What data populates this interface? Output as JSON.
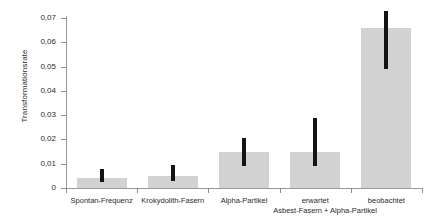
{
  "chart_data": {
    "type": "bar",
    "title": "",
    "xlabel": "",
    "ylabel": "Transformationsrate",
    "ylim": [
      0,
      0.07
    ],
    "yticks": [
      0,
      0.01,
      0.02,
      0.03,
      0.04,
      0.05,
      0.06,
      0.07
    ],
    "ytick_labels": [
      "0",
      "0,01",
      "0,02",
      "0,03",
      "0,04",
      "0,05",
      "0,06",
      "0,07"
    ],
    "grid": false,
    "legend": "none",
    "categories": [
      "Spontan-Frequenz",
      "Krokydolith-Fasern",
      "Alpha-Partikel",
      "erwartet",
      "beobachtet"
    ],
    "values": [
      0.004,
      0.005,
      0.015,
      0.015,
      0.066
    ],
    "error_low": [
      0.0025,
      0.003,
      0.009,
      0.009,
      0.049
    ],
    "error_high": [
      0.008,
      0.0095,
      0.0205,
      0.029,
      0.073
    ],
    "group_annotation": "Asbest-Fasern + Alpha-Partikel",
    "group_annotation_categories": [
      "erwartet",
      "beobachtet"
    ],
    "bar_color": "#d2d2d2",
    "error_color": "#141414",
    "axis_color": "#9a9a9a"
  }
}
